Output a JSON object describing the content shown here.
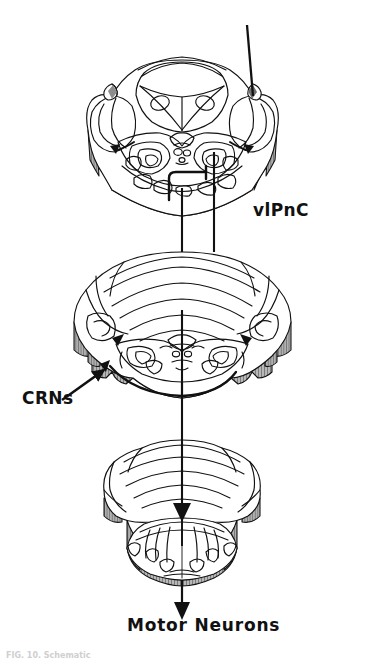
{
  "figure": {
    "type": "neuroanatomy-schematic",
    "background_color": "#ffffff",
    "ink_color": "#111111",
    "cut_surface_color": "#9a9a9a",
    "cut_surface_hatch_color": "#555555"
  },
  "labels": {
    "vlpnc": "vlPnC",
    "crns": "CRNs",
    "motor_neurons": "Motor Neurons"
  },
  "caption": {
    "clipped_text": "FIG. 10. Schematic"
  },
  "sections": [
    {
      "name": "midbrain-superior-colliculus",
      "order": 1,
      "label_ref": "vlpnc"
    },
    {
      "name": "pons-cerebellum",
      "order": 2,
      "label_ref": "crns"
    },
    {
      "name": "medulla",
      "order": 3,
      "label_ref": "motor_neurons"
    }
  ],
  "pathways": [
    {
      "name": "descending-input-line",
      "style": "solid",
      "terminus": "vlPnC"
    },
    {
      "name": "vlpnc-to-crns-projection",
      "style": "solid-hooked"
    },
    {
      "name": "crns-to-motor-neurons-axis",
      "style": "solid-arrow",
      "terminus": "Motor Neurons"
    }
  ]
}
